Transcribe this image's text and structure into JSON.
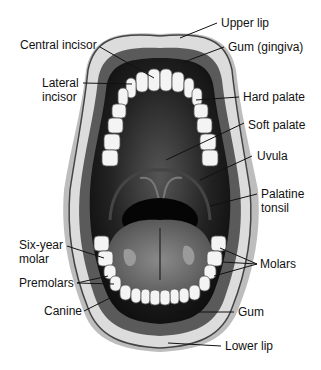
{
  "diagram": {
    "labels": {
      "upper_lip": "Upper lip",
      "gum_gingiva": "Gum (gingiva)",
      "central_incisor": "Central incisor",
      "lateral_incisor_1": "Lateral",
      "lateral_incisor_2": "incisor",
      "hard_palate": "Hard palate",
      "soft_palate": "Soft palate",
      "uvula": "Uvula",
      "palatine_tonsil_1": "Palatine",
      "palatine_tonsil_2": "tonsil",
      "six_year_molar_1": "Six-year",
      "six_year_molar_2": "molar",
      "molars": "Molars",
      "premolars": "Premolars",
      "canine": "Canine",
      "gum": "Gum",
      "lower_lip": "Lower lip"
    },
    "colors": {
      "lip": "#d8d8d8",
      "lip_outline": "#444444",
      "gum": "#5a5a5a",
      "mouth_cavity": "#1a1a1a",
      "tongue": "#6e6e6e",
      "teeth": "#f4f4f4"
    }
  }
}
